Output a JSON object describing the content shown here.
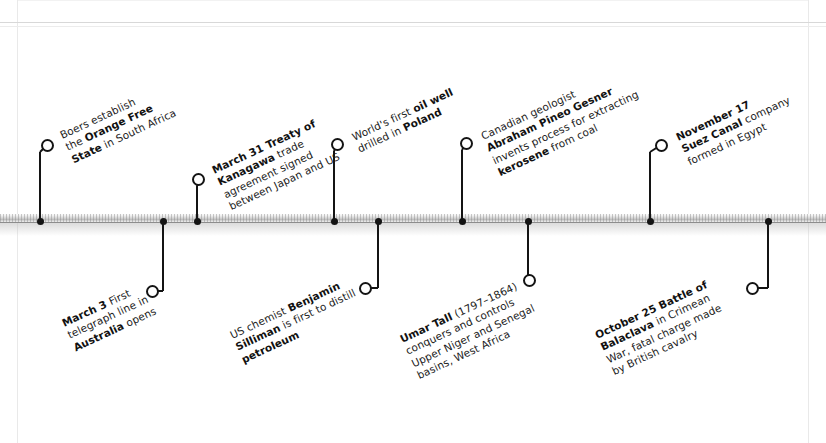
{
  "diagram": {
    "type": "horizontal-timeline",
    "title": "",
    "axis": {
      "orientation": "horizontal",
      "style": "3d-shaded-bar",
      "y": 222,
      "color": "#bdbdbd"
    },
    "colors": {
      "marker": "#141414",
      "text": "#1b1b1b",
      "axis": "#bdbdbd",
      "background": "#ffffff"
    },
    "events": [
      {
        "id": "orange-free-state",
        "position": "above",
        "marker_x": 40,
        "ring_x": 47,
        "ring_y": 145,
        "stem_top": 152,
        "label_x": 58,
        "label_y": 130,
        "lines": [
          [
            {
              "t": "Boers establish",
              "b": false
            }
          ],
          [
            {
              "t": "the ",
              "b": false
            },
            {
              "t": "Orange Free",
              "b": true
            }
          ],
          [
            {
              "t": "State",
              "b": true
            },
            {
              "t": " in South Africa",
              "b": false
            }
          ]
        ]
      },
      {
        "id": "telegraph-australia",
        "position": "below",
        "marker_x": 163,
        "ring_x": 152,
        "ring_y": 291,
        "stem_top": 222,
        "label_x": 60,
        "label_y": 318,
        "lines": [
          [
            {
              "t": "March 3",
              "b": true
            },
            {
              "t": " First",
              "b": false
            }
          ],
          [
            {
              "t": "telegraph line in",
              "b": false
            }
          ],
          [
            {
              "t": "Australia",
              "b": true
            },
            {
              "t": " opens",
              "b": false
            }
          ]
        ]
      },
      {
        "id": "treaty-of-kanagawa",
        "position": "above",
        "marker_x": 197,
        "ring_x": 198,
        "ring_y": 179,
        "stem_top": 186,
        "label_x": 210,
        "label_y": 165,
        "lines": [
          [
            {
              "t": "March 31 Treaty of",
              "b": true
            }
          ],
          [
            {
              "t": "Kanagawa",
              "b": true
            },
            {
              "t": " trade",
              "b": false
            }
          ],
          [
            {
              "t": "agreement signed",
              "b": false
            }
          ],
          [
            {
              "t": "between Japan and US",
              "b": false
            }
          ]
        ]
      },
      {
        "id": "first-oil-well-poland",
        "position": "above",
        "marker_x": 334,
        "ring_x": 337,
        "ring_y": 144,
        "stem_top": 151,
        "label_x": 350,
        "label_y": 132,
        "lines": [
          [
            {
              "t": "World's first ",
              "b": false
            },
            {
              "t": "oil well",
              "b": true
            }
          ],
          [
            {
              "t": "drilled in ",
              "b": false
            },
            {
              "t": "Poland",
              "b": true
            }
          ]
        ]
      },
      {
        "id": "silliman-petroleum",
        "position": "below",
        "marker_x": 378,
        "ring_x": 365,
        "ring_y": 288,
        "stem_top": 222,
        "label_x": 228,
        "label_y": 330,
        "lines": [
          [
            {
              "t": "US chemist ",
              "b": false
            },
            {
              "t": "Benjamin",
              "b": true
            }
          ],
          [
            {
              "t": "Silliman",
              "b": true
            },
            {
              "t": " is first to distill",
              "b": false
            }
          ],
          [
            {
              "t": "petroleum",
              "b": true
            }
          ]
        ]
      },
      {
        "id": "gesner-kerosene",
        "position": "above",
        "marker_x": 462,
        "ring_x": 466,
        "ring_y": 143,
        "stem_top": 150,
        "label_x": 479,
        "label_y": 131,
        "lines": [
          [
            {
              "t": "Canadian geologist",
              "b": false
            }
          ],
          [
            {
              "t": "Abraham Pineo Gesner",
              "b": true
            }
          ],
          [
            {
              "t": "invents process for extracting",
              "b": false
            }
          ],
          [
            {
              "t": "kerosene",
              "b": true
            },
            {
              "t": " from coal",
              "b": false
            }
          ]
        ]
      },
      {
        "id": "umar-tall",
        "position": "below",
        "marker_x": 528,
        "ring_x": 529,
        "ring_y": 280,
        "stem_top": 222,
        "label_x": 398,
        "label_y": 334,
        "lines": [
          [
            {
              "t": "Umar Tall",
              "b": true
            },
            {
              "t": " (1797–1864)",
              "b": false
            }
          ],
          [
            {
              "t": "conquers and controls",
              "b": false
            }
          ],
          [
            {
              "t": "Upper Niger and Senegal",
              "b": false
            }
          ],
          [
            {
              "t": "basins, West Africa",
              "b": false
            }
          ]
        ]
      },
      {
        "id": "suez-canal-company",
        "position": "above",
        "marker_x": 650,
        "ring_x": 661,
        "ring_y": 145,
        "stem_top": 152,
        "label_x": 674,
        "label_y": 132,
        "lines": [
          [
            {
              "t": "November 17",
              "b": true
            }
          ],
          [
            {
              "t": "Suez Canal",
              "b": true
            },
            {
              "t": " company",
              "b": false
            }
          ],
          [
            {
              "t": "formed in Egypt",
              "b": false
            }
          ]
        ]
      },
      {
        "id": "battle-of-balaclava",
        "position": "below",
        "marker_x": 768,
        "ring_x": 752,
        "ring_y": 288,
        "stem_top": 222,
        "label_x": 593,
        "label_y": 330,
        "lines": [
          [
            {
              "t": "October 25 Battle of",
              "b": true
            }
          ],
          [
            {
              "t": "Balaclava",
              "b": true
            },
            {
              "t": " in Crimean",
              "b": false
            }
          ],
          [
            {
              "t": "War, fatal charge made",
              "b": false
            }
          ],
          [
            {
              "t": "by British cavalry",
              "b": false
            }
          ]
        ]
      }
    ]
  }
}
